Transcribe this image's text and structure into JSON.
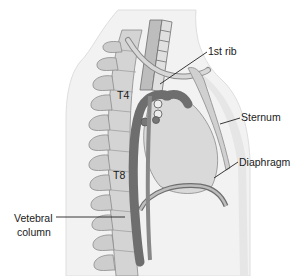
{
  "diagram": {
    "type": "anatomical-sagittal-section",
    "colors": {
      "body_outline": "#f2f2f2",
      "body_edge": "#d8d8d8",
      "bone": "#cfcfcf",
      "bone_edge": "#8a8a8a",
      "vessel": "#6e6e6e",
      "heart": "#d9d9d9",
      "line": "#222222",
      "text": "#1a1a1a"
    },
    "labels": {
      "first_rib": "1st rib",
      "sternum": "Sternum",
      "diaphragm": "Diaphragm",
      "vertebral_column_line1": "Vetebral",
      "vertebral_column_line2": "column"
    },
    "vertebra_labels": {
      "t4": "T4",
      "t8": "T8"
    }
  }
}
